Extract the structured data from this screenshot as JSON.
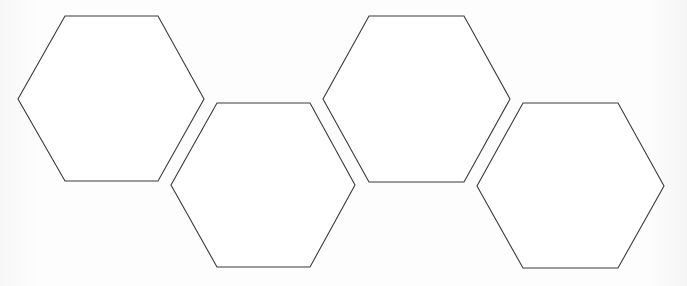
{
  "diagram": {
    "type": "hexagon-tiles",
    "stroke_color": "#3a3a3a",
    "fill_color": "#ffffff",
    "background_color": "#fdfdfd",
    "hexagons": [
      {
        "id": "hex-1",
        "points": "65,16 158,16 204,99 158,181 65,181 18,99"
      },
      {
        "id": "hex-2",
        "points": "217,103 310,103 355,185 310,267 217,267 171,185"
      },
      {
        "id": "hex-3",
        "points": "369,16 464,16 510,99 464,182 369,182 323,99"
      },
      {
        "id": "hex-4",
        "points": "523,103 618,103 664,186 618,268 523,268 477,186"
      }
    ]
  }
}
